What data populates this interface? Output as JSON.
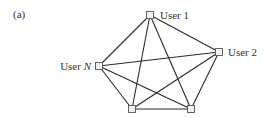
{
  "figure": {
    "panel_label": "(a)"
  },
  "nodes": [
    {
      "id": "user1",
      "label": "User 1",
      "x": 150,
      "y": 15,
      "label_side": "right"
    },
    {
      "id": "user2",
      "label": "User 2",
      "x": 219,
      "y": 52,
      "label_side": "right"
    },
    {
      "id": "userN",
      "label_prefix": "User ",
      "label_var": "N",
      "x": 99,
      "y": 66,
      "label_side": "left"
    },
    {
      "id": "bottom_left",
      "label": "",
      "x": 132,
      "y": 109
    },
    {
      "id": "bottom_right",
      "label": "",
      "x": 191,
      "y": 109
    }
  ],
  "edges": [
    [
      "user1",
      "user2"
    ],
    [
      "user1",
      "userN"
    ],
    [
      "user1",
      "bottom_left"
    ],
    [
      "user1",
      "bottom_right"
    ],
    [
      "user2",
      "userN"
    ],
    [
      "user2",
      "bottom_left"
    ],
    [
      "user2",
      "bottom_right"
    ],
    [
      "userN",
      "bottom_left"
    ],
    [
      "userN",
      "bottom_right"
    ],
    [
      "bottom_left",
      "bottom_right"
    ]
  ],
  "colors": {
    "edge": "#2a2a2a",
    "node_fill": "#f2f2f2",
    "node_stroke": "#555555",
    "text": "#333333"
  }
}
